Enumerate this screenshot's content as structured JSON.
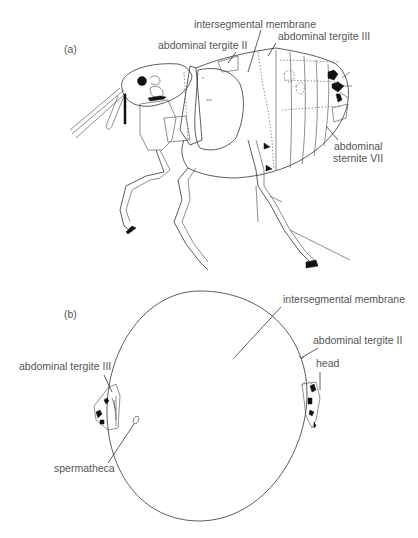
{
  "figure_a": {
    "panel_label": "(a)",
    "labels": {
      "intersegmental_membrane": "intersegmental membrane",
      "abdominal_tergite_II": "abdominal tergite II",
      "abdominal_tergite_III": "abdominal tergite III",
      "abdominal_sternite_VII_line1": "abdominal",
      "abdominal_sternite_VII_line2": "sternite VII"
    }
  },
  "figure_b": {
    "panel_label": "(b)",
    "labels": {
      "intersegmental_membrane": "intersegmental membrane",
      "abdominal_tergite_II": "abdominal tergite II",
      "abdominal_tergite_III": "abdominal tergite III",
      "head": "head",
      "spermatheca": "spermatheca"
    }
  }
}
